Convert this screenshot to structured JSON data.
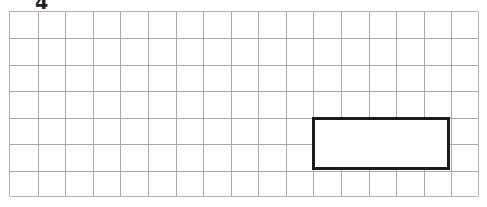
{
  "canvas": {
    "width": 487,
    "height": 207,
    "background_color": "#ffffff"
  },
  "annotations": {
    "top_label": {
      "text": "4",
      "x": 35,
      "y": -7,
      "color": "#222222",
      "note": "clipped at top edge of image"
    }
  },
  "grid": {
    "origin_x": 9,
    "origin_y": 11,
    "width": 469,
    "height": 185,
    "columns": 17,
    "rows": 7,
    "cell_width": 27.6,
    "cell_height": 26.4,
    "line_color": "#a9a9a9",
    "edge_color": "#b4b4b4",
    "fill_color": "#ffffff"
  },
  "shapes": [
    {
      "name": "rectangle",
      "type": "rectangle",
      "col_start": 11,
      "row_start": 4,
      "col_span": 5,
      "row_span": 2,
      "stroke_color": "#1b1b1b",
      "stroke_width": 3,
      "fill_color": "#ffffff",
      "x": 312.6,
      "y": 116.6,
      "width": 138,
      "height": 52.8
    }
  ]
}
